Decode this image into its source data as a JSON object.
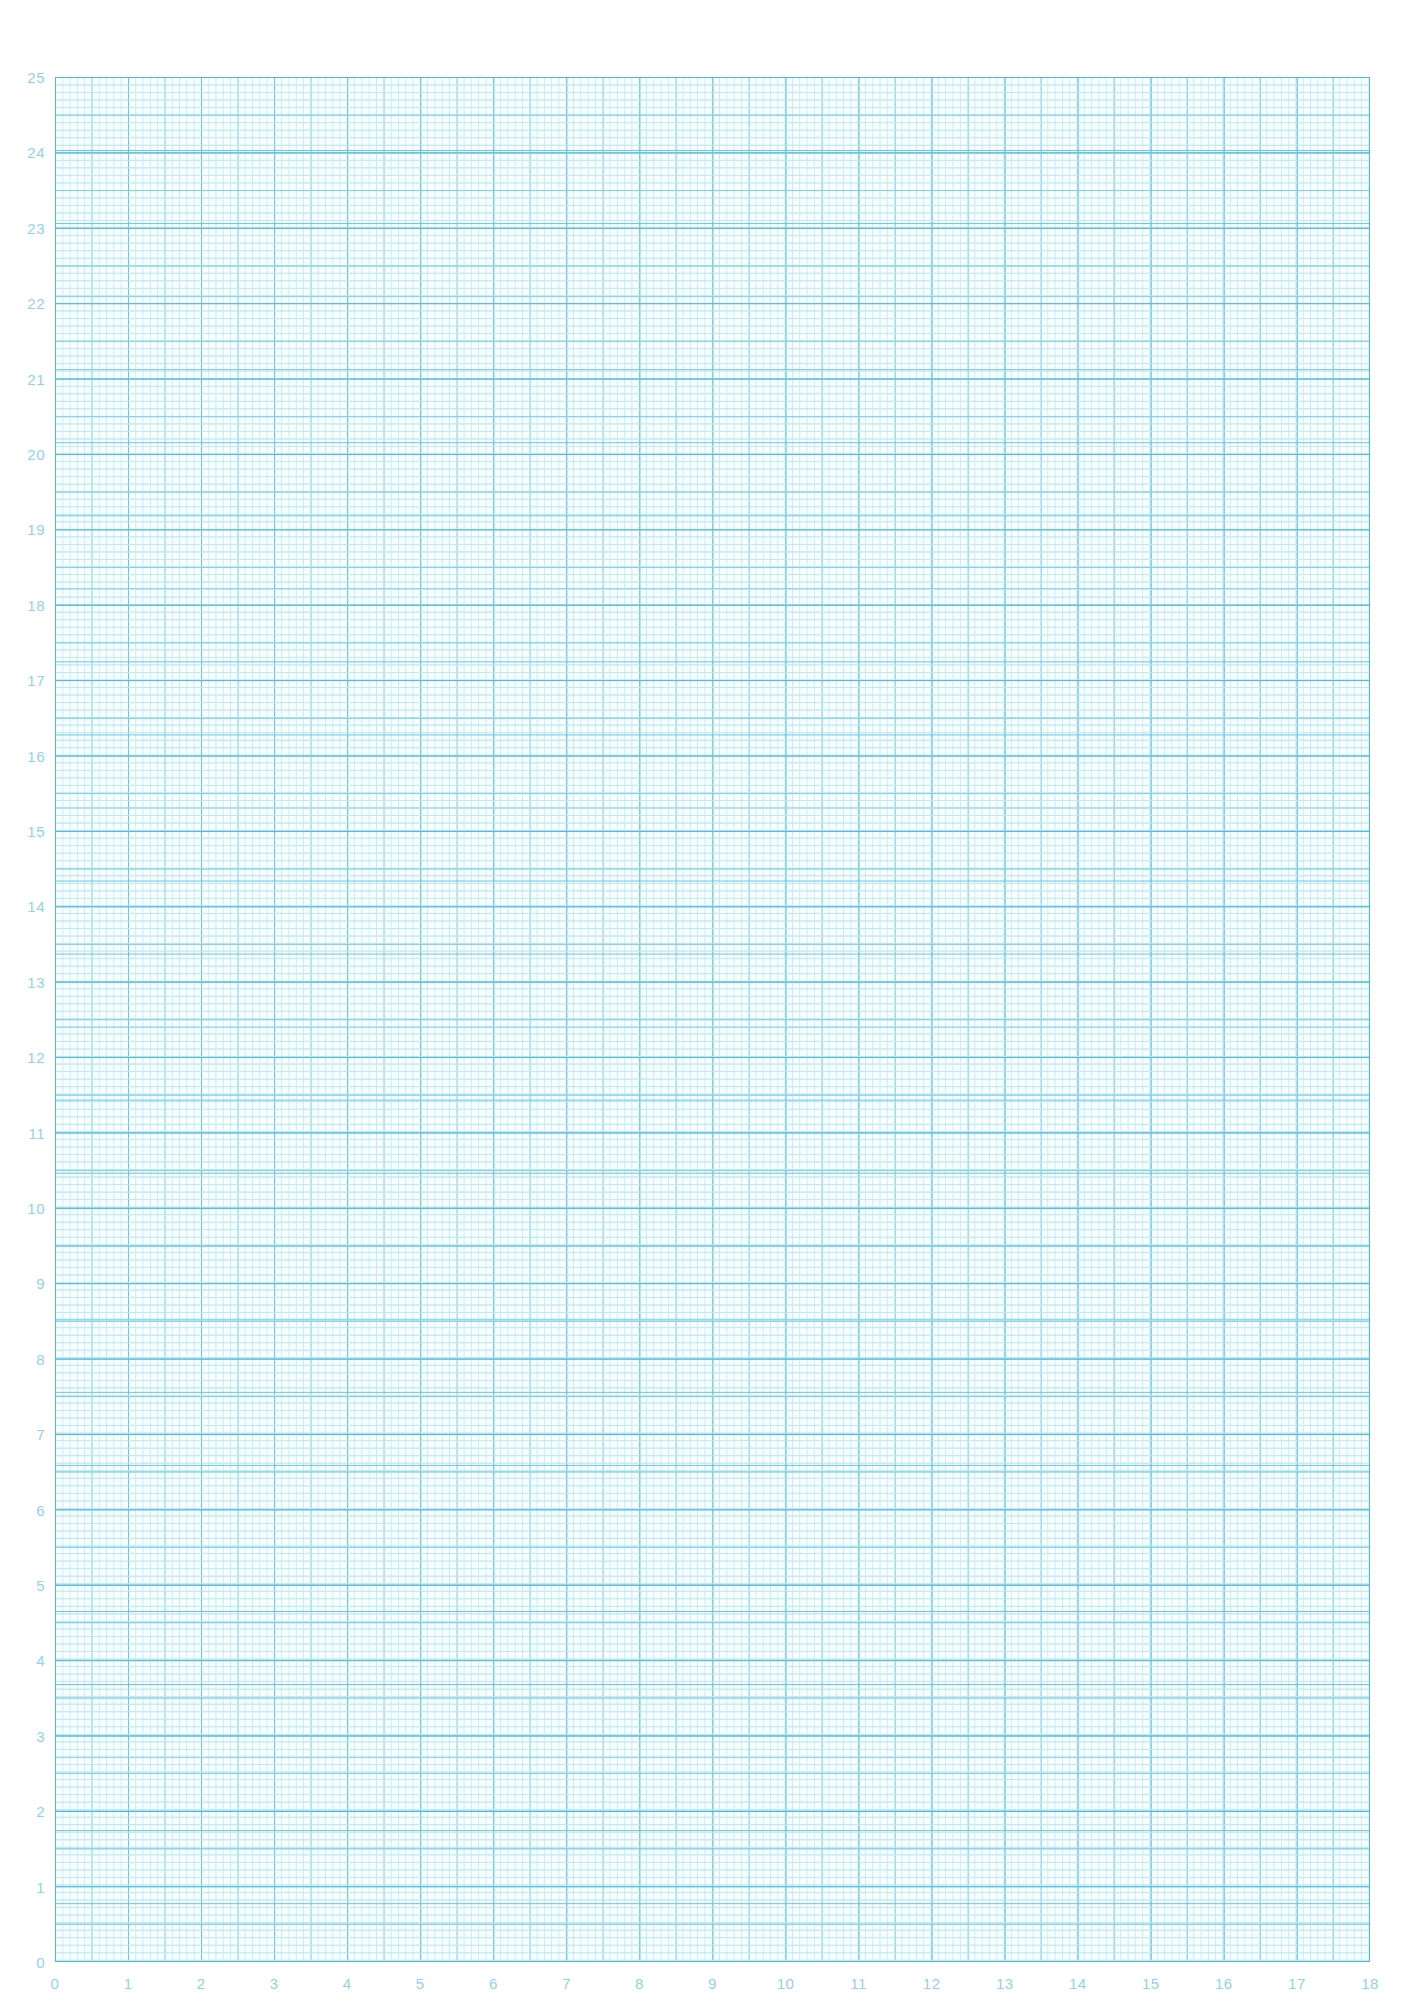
{
  "page": {
    "background_color": "#ffffff",
    "width": 1414,
    "height": 2009
  },
  "grid": {
    "left_px": 55,
    "top_px": 77,
    "width_px": 1315,
    "height_px": 1885,
    "heavy_line_color": "#4fb8e0",
    "medium_line_color": "#7fd0e8",
    "fine_line_color": "#bfe9f5",
    "border_color": "#4fb8e0",
    "label_color": "#8fd3e8",
    "subdivisions_per_unit": 10,
    "medium_every_n_fine": 5,
    "unit_width_px": 73.05,
    "unit_height_px": 75.4
  },
  "chart_data": {
    "type": "table",
    "title": "",
    "xlabel": "",
    "ylabel": "",
    "xlim": [
      0,
      18
    ],
    "ylim": [
      0,
      25
    ],
    "grid": true,
    "legend": "none",
    "series": [],
    "x_ticks": [
      0,
      1,
      2,
      3,
      4,
      5,
      6,
      7,
      8,
      9,
      10,
      11,
      12,
      13,
      14,
      15,
      16,
      17,
      18
    ],
    "y_ticks": [
      0,
      1,
      2,
      3,
      4,
      5,
      6,
      7,
      8,
      9,
      10,
      11,
      12,
      13,
      14,
      15,
      16,
      17,
      18,
      19,
      20,
      21,
      22,
      23,
      24,
      25
    ]
  },
  "x_axis": {
    "min": 0,
    "max": 18,
    "tick_labels": [
      "0",
      "1",
      "2",
      "3",
      "4",
      "5",
      "6",
      "7",
      "8",
      "9",
      "10",
      "11",
      "12",
      "13",
      "14",
      "15",
      "16",
      "17",
      "18"
    ]
  },
  "y_axis": {
    "min": 0,
    "max": 25,
    "tick_labels": [
      "0",
      "1",
      "2",
      "3",
      "4",
      "5",
      "6",
      "7",
      "8",
      "9",
      "10",
      "11",
      "12",
      "13",
      "14",
      "15",
      "16",
      "17",
      "18",
      "19",
      "20",
      "21",
      "22",
      "23",
      "24",
      "25"
    ]
  }
}
